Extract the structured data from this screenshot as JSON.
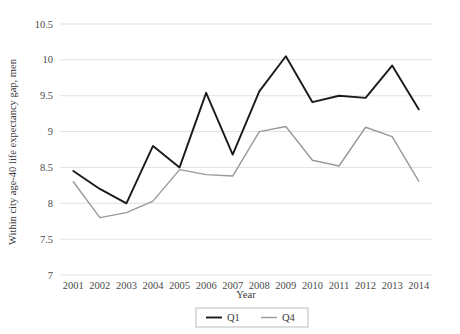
{
  "chart_data": {
    "type": "line",
    "title": "",
    "xlabel": "Year",
    "ylabel": "Within city age-40 life expectancy gap, men",
    "categories": [
      2001,
      2002,
      2003,
      2004,
      2005,
      2006,
      2007,
      2008,
      2009,
      2010,
      2011,
      2012,
      2013,
      2014
    ],
    "x": [
      "2001",
      "2002",
      "2003",
      "2004",
      "2005",
      "2006",
      "2007",
      "2008",
      "2009",
      "2010",
      "2011",
      "2012",
      "2013",
      "2014"
    ],
    "series": [
      {
        "name": "Q1",
        "color": "#1a1a1a",
        "values": [
          8.45,
          8.2,
          8.0,
          8.8,
          8.5,
          9.54,
          8.68,
          9.56,
          10.05,
          9.41,
          9.5,
          9.47,
          9.92,
          9.31
        ]
      },
      {
        "name": "Q4",
        "color": "#999999",
        "values": [
          8.3,
          7.8,
          7.87,
          8.03,
          8.47,
          8.4,
          8.38,
          9.0,
          9.07,
          8.6,
          8.52,
          9.06,
          8.93,
          8.31
        ]
      }
    ],
    "ylim": [
      7,
      10.5
    ],
    "yticks": [
      "7",
      "7.5",
      "8",
      "8.5",
      "9",
      "9.5",
      "10",
      "10.5"
    ],
    "ytick_values": [
      7,
      7.5,
      8,
      8.5,
      9,
      9.5,
      10,
      10.5
    ],
    "grid": true,
    "grid_color": "#d9d9d9",
    "legend_position": "bottom",
    "legend": [
      {
        "label": "Q1",
        "color": "#1a1a1a"
      },
      {
        "label": "Q4",
        "color": "#999999"
      }
    ]
  }
}
